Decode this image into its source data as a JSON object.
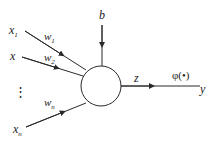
{
  "diagram": {
    "type": "perceptron-neuron",
    "colors": {
      "stroke": "#2a2a2a",
      "text": "#222222",
      "background": "#ffffff"
    },
    "inputs": [
      {
        "symbol": "x",
        "subscript": "1",
        "weight": "w",
        "weight_subscript": "1"
      },
      {
        "symbol": "x",
        "subscript": "",
        "weight": "w",
        "weight_subscript": "2"
      },
      {
        "symbol": "x",
        "subscript": "n",
        "weight": "w",
        "weight_subscript": "n"
      }
    ],
    "ellipsis": "⋮",
    "bias": "b",
    "sum_output": "z",
    "activation": "φ(•)",
    "output": "y"
  }
}
